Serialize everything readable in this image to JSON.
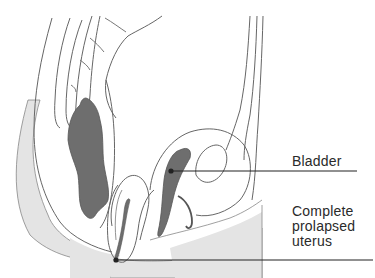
{
  "diagram": {
    "labels": [
      {
        "id": "bladder",
        "lines": [
          "Bladder"
        ]
      },
      {
        "id": "prolapsed-uterus",
        "lines": [
          "Complete",
          "prolapsed",
          "uterus"
        ]
      }
    ],
    "colors": {
      "outline": "#555555",
      "organ_fill": "#6e6e6e",
      "skin_fill": "#e4e4e4",
      "leader_line": "#222222",
      "background": "#ffffff"
    }
  }
}
